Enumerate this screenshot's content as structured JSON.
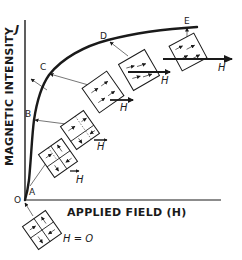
{
  "figure": {
    "y_axis_label": "MAGNETIC INTENSITY",
    "y_axis_symbol": "J",
    "x_axis_label": "APPLIED FIELD (H)",
    "origin_label": "O",
    "field_symbol": "H",
    "zero_field_label": "H = O"
  },
  "curve_points": [
    {
      "label": "A",
      "stage": "small field: favorably oriented domains grow"
    },
    {
      "label": "B",
      "stage": "domain wall motion"
    },
    {
      "label": "C",
      "stage": "unfavorable domains eliminated"
    },
    {
      "label": "D",
      "stage": "domain rotation toward field"
    },
    {
      "label": "E",
      "stage": "saturation, aligned with field"
    }
  ],
  "colors": {
    "ink": "#1a1a1a",
    "background": "#ffffff"
  }
}
